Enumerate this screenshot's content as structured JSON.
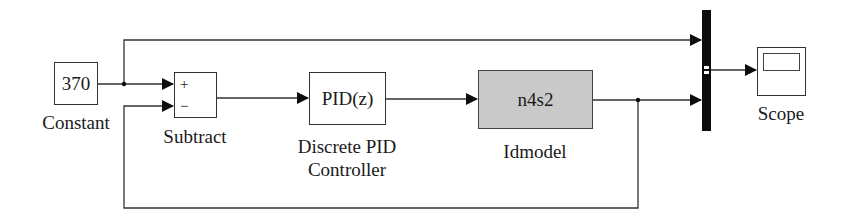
{
  "diagram": {
    "type": "simulink-block-diagram",
    "blocks": [
      {
        "id": "constant",
        "content": "370",
        "label": "Constant"
      },
      {
        "id": "subtract",
        "content": "",
        "signs": [
          "+",
          "−"
        ],
        "label": "Subtract"
      },
      {
        "id": "pid",
        "content": "PID(z)",
        "label_line1": "Discrete PID",
        "label_line2": "Controller"
      },
      {
        "id": "idmodel",
        "content": "n4s2",
        "label": "Idmodel"
      },
      {
        "id": "mux",
        "content": "",
        "label": ""
      },
      {
        "id": "scope",
        "content": "",
        "label": "Scope"
      }
    ],
    "connections": [
      {
        "from": "constant",
        "to": "subtract",
        "port": "+"
      },
      {
        "from": "constant",
        "to": "mux",
        "port": 1
      },
      {
        "from": "subtract",
        "to": "pid"
      },
      {
        "from": "pid",
        "to": "idmodel"
      },
      {
        "from": "idmodel",
        "to": "mux",
        "port": 2
      },
      {
        "from": "idmodel",
        "to": "subtract",
        "port": "−",
        "note": "feedback"
      },
      {
        "from": "mux",
        "to": "scope"
      }
    ],
    "colors": {
      "line": "#333333",
      "idmodel_fill": "#c9c9c9",
      "mux_fill": "#0d0d0d"
    }
  }
}
